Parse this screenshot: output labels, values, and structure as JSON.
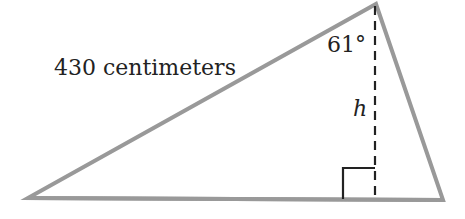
{
  "diagram": {
    "type": "triangle",
    "side_label": "430 centimeters",
    "angle_label": "61°",
    "height_label": "h",
    "colors": {
      "stroke": "#999999",
      "text": "#222222",
      "dash": "#222222"
    }
  }
}
